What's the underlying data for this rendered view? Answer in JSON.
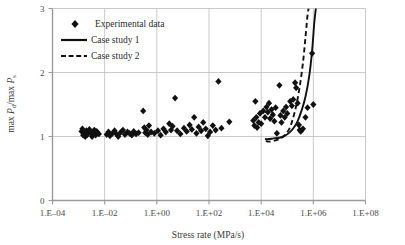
{
  "chart_data": {
    "type": "scatter",
    "title": "",
    "xlabel": "Stress rate (MPa/s)",
    "ylabel": "max P_d/max P_s",
    "ylabel_parts": {
      "prefix1": "max ",
      "sym1": "P",
      "sub1": "d",
      "slash": "/max ",
      "sym2": "P",
      "sub2": "s"
    },
    "xscale": "log",
    "yscale": "linear",
    "xlim": [
      0.0001,
      100000000.0
    ],
    "ylim": [
      0,
      3
    ],
    "grid": true,
    "legend_position": "upper-left-inside",
    "xticks": [
      0.0001,
      0.01,
      1.0,
      100.0,
      10000.0,
      1000000.0,
      100000000.0
    ],
    "xtick_labels": [
      "1.E‒04",
      "1.E‒02",
      "1.E+00",
      "1.E+02",
      "1.E+04",
      "1.E+06",
      "1.E+08"
    ],
    "yticks": [
      0,
      1,
      2,
      3
    ],
    "ytick_labels": [
      "0",
      "1",
      "2",
      "3"
    ],
    "series": [
      {
        "name": "Experimental data",
        "type": "scatter",
        "marker": "diamond",
        "color": "#111111",
        "points": [
          [
            0.0013,
            1.08
          ],
          [
            0.0014,
            1.12
          ],
          [
            0.0015,
            1.02
          ],
          [
            0.0016,
            1.05
          ],
          [
            0.0018,
            1.0
          ],
          [
            0.002,
            1.09
          ],
          [
            0.0022,
            1.03
          ],
          [
            0.0024,
            1.07
          ],
          [
            0.0026,
            1.11
          ],
          [
            0.003,
            1.05
          ],
          [
            0.0033,
            1.0
          ],
          [
            0.0037,
            1.06
          ],
          [
            0.004,
            1.1
          ],
          [
            0.0045,
            1.02
          ],
          [
            0.005,
            1.08
          ],
          [
            0.006,
            1.04
          ],
          [
            0.012,
            1.03
          ],
          [
            0.014,
            1.07
          ],
          [
            0.016,
            1.01
          ],
          [
            0.02,
            1.05
          ],
          [
            0.024,
            1.09
          ],
          [
            0.028,
            1.04
          ],
          [
            0.033,
            1.0
          ],
          [
            0.04,
            1.06
          ],
          [
            0.05,
            1.1
          ],
          [
            0.06,
            1.03
          ],
          [
            0.075,
            1.07
          ],
          [
            0.09,
            1.05
          ],
          [
            0.11,
            1.02
          ],
          [
            0.13,
            1.08
          ],
          [
            0.16,
            1.04
          ],
          [
            0.2,
            1.06
          ],
          [
            0.3,
            1.4
          ],
          [
            0.33,
            1.14
          ],
          [
            0.36,
            1.06
          ],
          [
            0.4,
            1.1
          ],
          [
            0.45,
            1.03
          ],
          [
            0.5,
            1.17
          ],
          [
            0.6,
            1.07
          ],
          [
            0.8,
            1.05
          ],
          [
            1.1,
            1.09
          ],
          [
            1.4,
            1.02
          ],
          [
            1.8,
            1.12
          ],
          [
            2.2,
            1.07
          ],
          [
            3.0,
            1.2
          ],
          [
            3.5,
            1.1
          ],
          [
            4.0,
            1.16
          ],
          [
            5.0,
            1.6
          ],
          [
            6.0,
            1.09
          ],
          [
            8.0,
            1.04
          ],
          [
            11,
            1.13
          ],
          [
            14,
            1.08
          ],
          [
            18,
            1.18
          ],
          [
            22,
            1.11
          ],
          [
            27,
            1.3
          ],
          [
            33,
            1.05
          ],
          [
            40,
            1.15
          ],
          [
            50,
            1.09
          ],
          [
            60,
            1.22
          ],
          [
            75,
            1.12
          ],
          [
            90,
            1.01
          ],
          [
            110,
            1.07
          ],
          [
            140,
            1.17
          ],
          [
            180,
            1.1
          ],
          [
            230,
            1.86
          ],
          [
            300,
            1.13
          ],
          [
            600,
            1.23
          ],
          [
            5000,
            1.25
          ],
          [
            5500,
            1.17
          ],
          [
            6000,
            1.55
          ],
          [
            6500,
            1.3
          ],
          [
            7000,
            1.14
          ],
          [
            8000,
            1.22
          ],
          [
            9000,
            1.36
          ],
          [
            10000,
            1.2
          ],
          [
            12000,
            1.4
          ],
          [
            14000,
            1.3
          ],
          [
            16000,
            1.46
          ],
          [
            18000,
            1.38
          ],
          [
            20000,
            1.52
          ],
          [
            22000,
            1.28
          ],
          [
            25000,
            1.42
          ],
          [
            28000,
            1.34
          ],
          [
            32000,
            1.24
          ],
          [
            36000,
            1.45
          ],
          [
            40000,
            1.05
          ],
          [
            50000,
            1.8
          ],
          [
            55000,
            1.33
          ],
          [
            60000,
            1.22
          ],
          [
            70000,
            1.4
          ],
          [
            80000,
            1.3
          ],
          [
            90000,
            1.46
          ],
          [
            100000,
            1.36
          ],
          [
            130000,
            1.55
          ],
          [
            150000,
            1.48
          ],
          [
            170000,
            1.58
          ],
          [
            200000,
            1.84
          ],
          [
            220000,
            1.76
          ],
          [
            250000,
            1.52
          ],
          [
            280000,
            1.18
          ],
          [
            300000,
            1.1
          ],
          [
            330000,
            1.08
          ],
          [
            400000,
            1.12
          ],
          [
            500000,
            1.3
          ],
          [
            600000,
            1.45
          ],
          [
            900000,
            2.3
          ],
          [
            1000000,
            1.5
          ]
        ]
      },
      {
        "name": "Case study 1",
        "type": "line",
        "style": "solid",
        "color": "#111111",
        "points": [
          [
            15000,
            0.96
          ],
          [
            20000,
            0.96
          ],
          [
            30000,
            0.97
          ],
          [
            50000,
            0.98
          ],
          [
            80000,
            1.01
          ],
          [
            120000,
            1.06
          ],
          [
            180000,
            1.14
          ],
          [
            250000,
            1.24
          ],
          [
            350000,
            1.4
          ],
          [
            500000,
            1.62
          ],
          [
            700000,
            1.95
          ],
          [
            900000,
            2.35
          ],
          [
            1100000,
            2.8
          ],
          [
            1250000,
            3.0
          ]
        ]
      },
      {
        "name": "Case study 2",
        "type": "line",
        "style": "dashed",
        "color": "#111111",
        "points": [
          [
            15000,
            0.93
          ],
          [
            20000,
            0.92
          ],
          [
            30000,
            0.93
          ],
          [
            50000,
            0.96
          ],
          [
            80000,
            1.02
          ],
          [
            120000,
            1.12
          ],
          [
            160000,
            1.26
          ],
          [
            220000,
            1.48
          ],
          [
            300000,
            1.78
          ],
          [
            400000,
            2.15
          ],
          [
            500000,
            2.55
          ],
          [
            600000,
            2.9
          ],
          [
            660000,
            3.0
          ]
        ]
      }
    ]
  },
  "legend": {
    "items": [
      {
        "label": "Experimental data",
        "glyph": "diamond-marker"
      },
      {
        "label": "Case study 1",
        "glyph": "solid-line"
      },
      {
        "label": "Case study 2",
        "glyph": "dashed-line"
      }
    ]
  },
  "axes": {
    "x_title": "Stress rate (MPa/s)",
    "y_title": "max Pd/max Ps"
  },
  "colors": {
    "gridline": "#bcbcbc",
    "spine": "#9a9a9a",
    "data": "#111111",
    "text": "#2b2b2b"
  }
}
